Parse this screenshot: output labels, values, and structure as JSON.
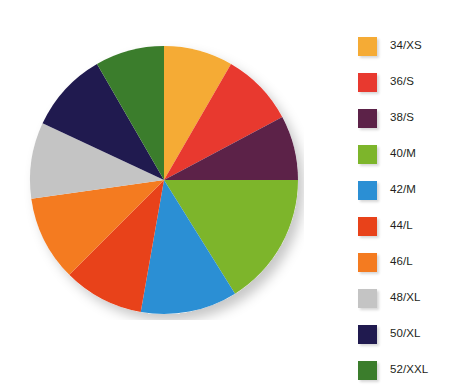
{
  "chart_data": {
    "type": "pie",
    "title": "",
    "subtitle": "",
    "xlabel": "",
    "ylabel": "",
    "grid": false,
    "legend_position": "right",
    "start_angle_deg": 0,
    "direction": "clockwise",
    "center": {
      "x": 140,
      "y": 140
    },
    "radius": 134,
    "categories": [
      "34/XS",
      "36/S",
      "38/S",
      "40/M",
      "42/M",
      "44/L",
      "46/L",
      "48/XL",
      "50/XL",
      "52/XXL"
    ],
    "values": [
      8.3,
      8.9,
      7.8,
      16.1,
      11.7,
      9.7,
      10.3,
      9.2,
      9.7,
      8.3
    ],
    "colors": [
      "#f5ab35",
      "#e8392f",
      "#5c2248",
      "#7db52b",
      "#2b8fd4",
      "#e8421a",
      "#f47b20",
      "#c4c4c4",
      "#201a4f",
      "#3b7d2c"
    ],
    "slice_angles_deg": [
      {
        "start": 0,
        "end": 30
      },
      {
        "start": 30,
        "end": 62
      },
      {
        "start": 62,
        "end": 90
      },
      {
        "start": 90,
        "end": 148
      },
      {
        "start": 148,
        "end": 190
      },
      {
        "start": 190,
        "end": 225
      },
      {
        "start": 225,
        "end": 262
      },
      {
        "start": 262,
        "end": 295
      },
      {
        "start": 295,
        "end": 330
      },
      {
        "start": 330,
        "end": 360
      }
    ],
    "slices": [
      {
        "label": "34/XS",
        "value": 8.3,
        "color": "#f5ab35"
      },
      {
        "label": "36/S",
        "value": 8.9,
        "color": "#e8392f"
      },
      {
        "label": "38/S",
        "value": 7.8,
        "color": "#5c2248"
      },
      {
        "label": "40/M",
        "value": 16.1,
        "color": "#7db52b"
      },
      {
        "label": "42/M",
        "value": 11.7,
        "color": "#2b8fd4"
      },
      {
        "label": "44/L",
        "value": 9.7,
        "color": "#e8421a"
      },
      {
        "label": "46/L",
        "value": 10.3,
        "color": "#f47b20"
      },
      {
        "label": "48/XL",
        "value": 9.2,
        "color": "#c4c4c4"
      },
      {
        "label": "50/XL",
        "value": 9.7,
        "color": "#201a4f"
      },
      {
        "label": "52/XXL",
        "value": 8.3,
        "color": "#3b7d2c"
      }
    ]
  },
  "legend": {
    "items": [
      {
        "label": "34/XS",
        "color": "#f5ab35"
      },
      {
        "label": "36/S",
        "color": "#e8392f"
      },
      {
        "label": "38/S",
        "color": "#5c2248"
      },
      {
        "label": "40/M",
        "color": "#7db52b"
      },
      {
        "label": "42/M",
        "color": "#2b8fd4"
      },
      {
        "label": "44/L",
        "color": "#e8421a"
      },
      {
        "label": "46/L",
        "color": "#f47b20"
      },
      {
        "label": "48/XL",
        "color": "#c4c4c4"
      },
      {
        "label": "50/XL",
        "color": "#201a4f"
      },
      {
        "label": "52/XXL",
        "color": "#3b7d2c"
      }
    ]
  }
}
